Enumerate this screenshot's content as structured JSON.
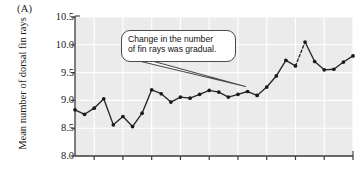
{
  "figure": {
    "panel_label": "(A)",
    "background_color": "#ffffff",
    "plot_background_color": "#ebebeb",
    "gridline_color": "#ffffff",
    "line_color": "#262626",
    "marker_color": "#1a1a1a"
  },
  "annotation": {
    "text": "Change in the number of fin rays was gradual.",
    "line1": "Change in the number",
    "line2": "of fin rays was gradual."
  },
  "chart_data": {
    "type": "line",
    "title": "",
    "xlabel": "",
    "ylabel": "Mean number of dorsal fin rays",
    "ylim": [
      8.0,
      10.5
    ],
    "yticks": [
      8.0,
      8.5,
      9.0,
      9.5,
      10.0,
      10.5
    ],
    "ytick_labels": [
      "8.0",
      "8.5",
      "9.0",
      "9.5",
      "10.0",
      "10.5"
    ],
    "xlim": [
      0,
      29
    ],
    "xticks": [
      2,
      5,
      8,
      11,
      14,
      17,
      20,
      23,
      26,
      29
    ],
    "xtick_labels": [],
    "grid": true,
    "legend_position": "none",
    "markers": "filled-circle",
    "x": [
      0,
      1,
      2,
      3,
      4,
      5,
      6,
      7,
      8,
      9,
      10,
      11,
      12,
      13,
      14,
      15,
      16,
      17,
      18,
      19,
      20,
      21,
      22,
      23,
      24,
      25,
      26,
      27,
      28,
      29
    ],
    "values": [
      8.83,
      8.75,
      8.86,
      9.03,
      8.56,
      8.71,
      8.53,
      8.77,
      9.19,
      9.12,
      8.97,
      9.06,
      9.04,
      9.11,
      9.18,
      9.15,
      9.06,
      9.11,
      9.16,
      9.09,
      9.24,
      9.44,
      9.72,
      9.62,
      10.05,
      9.7,
      9.55,
      9.56,
      9.69,
      9.8
    ],
    "dashed_segment": {
      "from_index": 23,
      "to_index": 24
    },
    "series": [
      {
        "name": "Mean number of dorsal fin rays",
        "values": [
          8.83,
          8.75,
          8.86,
          9.03,
          8.56,
          8.71,
          8.53,
          8.77,
          9.19,
          9.12,
          8.97,
          9.06,
          9.04,
          9.11,
          9.18,
          9.15,
          9.06,
          9.11,
          9.16,
          9.09,
          9.24,
          9.44,
          9.72,
          9.62,
          10.05,
          9.7,
          9.55,
          9.56,
          9.69,
          9.8
        ]
      }
    ],
    "annotations": [
      {
        "text": "Change in the number of fin rays was gradual.",
        "points_to_index": 18
      }
    ]
  }
}
